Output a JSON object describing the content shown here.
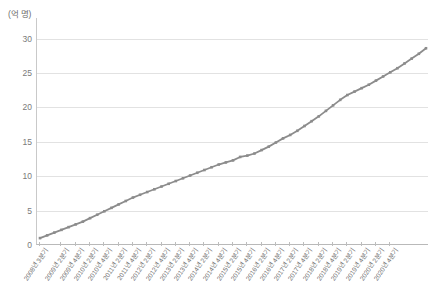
{
  "chart_data": {
    "type": "line",
    "title": "",
    "subtitle": "",
    "xlabel": "",
    "ylabel": "(억 명)",
    "unit_label": "(억 명)",
    "ylim": [
      0,
      33
    ],
    "yticks": [
      0,
      5,
      10,
      15,
      20,
      25,
      30
    ],
    "ytick_labels": [
      "0",
      "5",
      "10",
      "15",
      "20",
      "25",
      "30"
    ],
    "grid": true,
    "legend": false,
    "legend_position": "none",
    "series_color": "#8c8c8c",
    "marker": "square",
    "categories": [
      "2008년 3분기",
      "2008년 4분기",
      "2009년 1분기",
      "2009년 2분기",
      "2009년 3분기",
      "2009년 4분기",
      "2010년 1분기",
      "2010년 2분기",
      "2010년 3분기",
      "2010년 4분기",
      "2011년 1분기",
      "2011년 2분기",
      "2011년 3분기",
      "2011년 4분기",
      "2012년 1분기",
      "2012년 2분기",
      "2012년 3분기",
      "2012년 4분기",
      "2013년 1분기",
      "2013년 2분기",
      "2013년 3분기",
      "2013년 4분기",
      "2014년 1분기",
      "2014년 2분기",
      "2014년 3분기",
      "2014년 4분기",
      "2015년 1분기",
      "2015년 2분기",
      "2015년 3분기",
      "2015년 4분기",
      "2016년 1분기",
      "2016년 2분기",
      "2016년 3분기",
      "2016년 4분기",
      "2017년 1분기",
      "2017년 2분기",
      "2017년 3분기",
      "2017년 4분기",
      "2018년 1분기",
      "2018년 2분기",
      "2018년 3분기",
      "2018년 4분기",
      "2019년 1분기",
      "2019년 2분기",
      "2019년 3분기",
      "2019년 4분기",
      "2020년 1분기",
      "2020년 2분기",
      "2020년 3분기",
      "2020년 4분기"
    ],
    "tick_label_indices": [
      0,
      3,
      5,
      7,
      9,
      11,
      13,
      15,
      17,
      19,
      21,
      23,
      25,
      27,
      29,
      31,
      33,
      35,
      37,
      39,
      41,
      43,
      45,
      47,
      49
    ],
    "visible_tick_labels": [
      "2008년 3분기",
      "2009년 2분기",
      "2009년 4분기",
      "2010년 2분기",
      "2010년 4분기",
      "2011년 2분기",
      "2011년 4분기",
      "2012년 2분기",
      "2012년 4분기",
      "2013년 2분기",
      "2013년 4분기",
      "2014년 2분기",
      "2014년 4분기",
      "2015년 2분기",
      "2015년 4분기",
      "2016년 2분기",
      "2016년 4분기",
      "2017년 2분기",
      "2017년 4분기",
      "2018년 2분기",
      "2018년 4분기",
      "2019년 2분기",
      "2019년 4분기",
      "2020년 2분기",
      "2020년 4분기"
    ],
    "values": [
      1.0,
      1.4,
      1.8,
      2.2,
      2.6,
      3.0,
      3.4,
      3.9,
      4.4,
      4.9,
      5.4,
      5.9,
      6.4,
      6.9,
      7.3,
      7.7,
      8.1,
      8.5,
      8.9,
      9.3,
      9.7,
      10.1,
      10.5,
      10.9,
      11.3,
      11.7,
      12.0,
      12.3,
      12.8,
      13.0,
      13.3,
      13.8,
      14.3,
      14.9,
      15.5,
      16.0,
      16.6,
      17.3,
      18.0,
      18.7,
      19.5,
      20.3,
      21.1,
      21.8,
      22.3,
      22.8,
      23.3,
      23.9,
      24.5,
      25.1
    ],
    "values_tail": [
      25.7,
      26.4,
      27.1,
      27.8,
      28.6
    ],
    "y_start": 1.0,
    "y_end": 28.6
  }
}
